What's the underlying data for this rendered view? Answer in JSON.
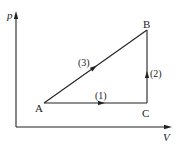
{
  "diagram": {
    "type": "pV-diagram",
    "axes": {
      "y_label": "p",
      "x_label": "V"
    },
    "points": [
      {
        "id": "A",
        "label": "A",
        "x": 44,
        "y": 103
      },
      {
        "id": "B",
        "label": "B",
        "x": 147,
        "y": 30
      },
      {
        "id": "C",
        "label": "C",
        "x": 147,
        "y": 103
      }
    ],
    "processes": [
      {
        "id": "1",
        "label": "(1)",
        "from": "A",
        "to": "C",
        "direction": "A→C",
        "kind": "isobaric"
      },
      {
        "id": "2",
        "label": "(2)",
        "from": "C",
        "to": "B",
        "direction": "C→B",
        "kind": "isochoric"
      },
      {
        "id": "3",
        "label": "(3)",
        "from": "A",
        "to": "B",
        "direction": "A→B",
        "kind": "linear"
      }
    ],
    "colors": {
      "line": "#222222",
      "background": "#ffffff"
    }
  }
}
